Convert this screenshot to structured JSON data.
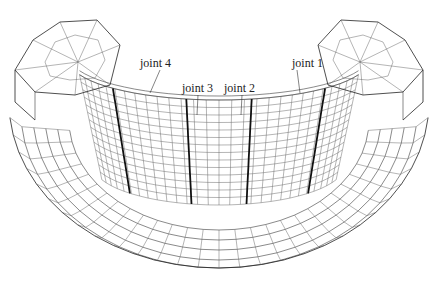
{
  "figure": {
    "labels": [
      {
        "id": "joint-4",
        "text": "joint 4",
        "x": 140,
        "y": 57
      },
      {
        "id": "joint-3",
        "text": "joint 3",
        "x": 182,
        "y": 82
      },
      {
        "id": "joint-2",
        "text": "joint 2",
        "x": 224,
        "y": 82
      },
      {
        "id": "joint-1",
        "text": "joint 1",
        "x": 292,
        "y": 57
      }
    ],
    "colors": {
      "background": "#ffffff",
      "mesh": "#3a3a3a",
      "joint_line": "#111111",
      "text": "#222222"
    }
  }
}
